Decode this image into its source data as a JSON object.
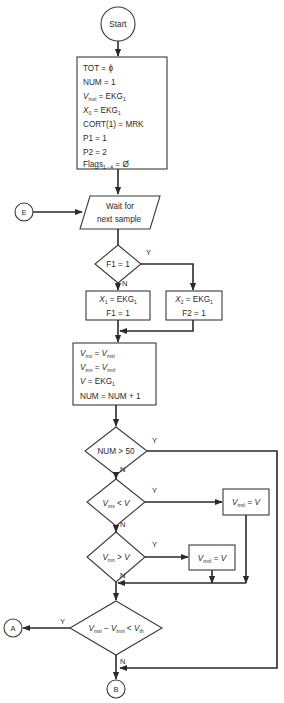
{
  "flowchart": {
    "start": {
      "label": "Start"
    },
    "init_box": {
      "lines": [
        {
          "text": "TOT = ϕ"
        },
        {
          "text": "NUM = 1"
        },
        {
          "var": "V",
          "sub": "mxl",
          "rest": " = EKG",
          "rest_sub": "1"
        },
        {
          "var": "X",
          "sub": "0",
          "rest": " = EKG",
          "rest_sub": "1"
        },
        {
          "text": "CORT(1) = MRK"
        },
        {
          "text": "P1 = 1"
        },
        {
          "text": "P2 = 2"
        },
        {
          "text": "Flags",
          "sub": "1 - 4",
          "rest": " = Ø"
        }
      ]
    },
    "connector_e": {
      "label": "E"
    },
    "wait": {
      "line1": "Wait for",
      "line2": "next sample"
    },
    "decision_f1": {
      "label": "F1 = 1",
      "yes": "Y",
      "no": "N"
    },
    "box_x1": {
      "line1_var": "X",
      "line1_sub": "1",
      "line1_rest": " = EKG",
      "line1_rest_sub": "1",
      "line2": "F1 = 1"
    },
    "box_x2": {
      "line1_var": "X",
      "line1_sub": "2",
      "line1_rest": " = EKG",
      "line1_rest_sub": "1",
      "line2": "F2 = 1"
    },
    "update_box": {
      "l1_var": "V",
      "l1_sub": "mx",
      "l1_eq": " = ",
      "l1_var2": "V",
      "l1_sub2": "mxl",
      "l2_var": "V",
      "l2_sub": "mn",
      "l2_eq": " = ",
      "l2_var2": "V",
      "l2_sub2": "mnl",
      "l3_var": "V",
      "l3_rest": " = EKG",
      "l3_sub": "1",
      "l4": "NUM = NUM + 1"
    },
    "decision_num": {
      "label": "NUM > 50",
      "yes": "Y",
      "no": "N"
    },
    "decision_vmx": {
      "var": "V",
      "sub": "mx",
      "op": " < ",
      "var2": "V",
      "yes": "Y",
      "no": "N"
    },
    "box_vmxl": {
      "var": "V",
      "sub": "mxl",
      "rest": " = ",
      "var2": "V"
    },
    "decision_vmn": {
      "var": "V",
      "sub": "mn",
      "op": " > ",
      "var2": "V",
      "yes": "Y",
      "no": "N"
    },
    "box_vmnl": {
      "var": "V",
      "sub": "mnl",
      "rest": " = ",
      "var2": "V"
    },
    "decision_final": {
      "v1": "V",
      "s1": "mxl",
      "op1": " − ",
      "v2": "V",
      "s2": "mnl",
      "op2": " < ",
      "v3": "V",
      "s3": "th",
      "yes": "Y",
      "no": "N"
    },
    "connector_a": {
      "label": "A"
    },
    "connector_b": {
      "label": "B"
    },
    "colors": {
      "stroke": "#2a2a2a",
      "background": "#ffffff"
    }
  }
}
